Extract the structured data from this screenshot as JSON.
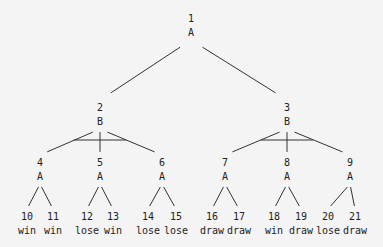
{
  "diagram": {
    "type": "game-tree",
    "nodes": [
      {
        "id": "1",
        "label": "A",
        "x": 191,
        "y": 18
      },
      {
        "id": "2",
        "label": "B",
        "x": 100,
        "y": 107
      },
      {
        "id": "3",
        "label": "B",
        "x": 287,
        "y": 107
      },
      {
        "id": "4",
        "label": "A",
        "x": 40,
        "y": 162
      },
      {
        "id": "5",
        "label": "A",
        "x": 100,
        "y": 162
      },
      {
        "id": "6",
        "label": "A",
        "x": 162,
        "y": 162
      },
      {
        "id": "7",
        "label": "A",
        "x": 225,
        "y": 162
      },
      {
        "id": "8",
        "label": "A",
        "x": 287,
        "y": 162
      },
      {
        "id": "9",
        "label": "A",
        "x": 350,
        "y": 162
      }
    ],
    "leaves": [
      {
        "id": "10",
        "outcome": "win",
        "x": 27,
        "y": 216
      },
      {
        "id": "11",
        "outcome": "win",
        "x": 53,
        "y": 216
      },
      {
        "id": "12",
        "outcome": "lose",
        "x": 87,
        "y": 216
      },
      {
        "id": "13",
        "outcome": "win",
        "x": 113,
        "y": 216
      },
      {
        "id": "14",
        "outcome": "lose",
        "x": 148,
        "y": 216
      },
      {
        "id": "15",
        "outcome": "lose",
        "x": 176,
        "y": 216
      },
      {
        "id": "16",
        "outcome": "draw",
        "x": 212,
        "y": 216
      },
      {
        "id": "17",
        "outcome": "draw",
        "x": 239,
        "y": 216
      },
      {
        "id": "18",
        "outcome": "win",
        "x": 274,
        "y": 216
      },
      {
        "id": "19",
        "outcome": "draw",
        "x": 301,
        "y": 216
      },
      {
        "id": "20",
        "outcome": "lose",
        "x": 328,
        "y": 216
      },
      {
        "id": "21",
        "outcome": "draw",
        "x": 355,
        "y": 216
      }
    ],
    "edges": [
      {
        "from": "1",
        "to": "2"
      },
      {
        "from": "1",
        "to": "3"
      },
      {
        "from": "2",
        "to": "4"
      },
      {
        "from": "2",
        "to": "5"
      },
      {
        "from": "2",
        "to": "6"
      },
      {
        "from": "3",
        "to": "7"
      },
      {
        "from": "3",
        "to": "8"
      },
      {
        "from": "3",
        "to": "9"
      },
      {
        "from": "4",
        "to": "10"
      },
      {
        "from": "4",
        "to": "11"
      },
      {
        "from": "5",
        "to": "12"
      },
      {
        "from": "5",
        "to": "13"
      },
      {
        "from": "6",
        "to": "14"
      },
      {
        "from": "6",
        "to": "15"
      },
      {
        "from": "7",
        "to": "16"
      },
      {
        "from": "7",
        "to": "17"
      },
      {
        "from": "8",
        "to": "18"
      },
      {
        "from": "8",
        "to": "19"
      },
      {
        "from": "9",
        "to": "20"
      },
      {
        "from": "9",
        "to": "21"
      }
    ],
    "and_arcs": [
      {
        "node": "2",
        "x1": 74,
        "x2": 126,
        "y": 140
      },
      {
        "node": "3",
        "x1": 261,
        "x2": 313,
        "y": 140
      }
    ]
  }
}
